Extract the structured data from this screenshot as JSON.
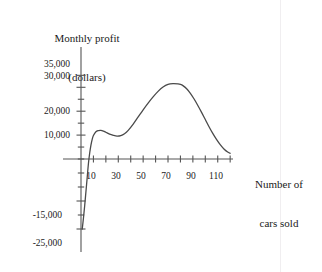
{
  "chart_data": {
    "type": "line",
    "title": "",
    "ylabel": "Monthly profit\n(dollars)",
    "ylabel_line1": "Monthly profit",
    "ylabel_line2": "(dollars)",
    "xlabel": "Number of\ncars sold",
    "xlabel_line1": "Number of",
    "xlabel_line2": "cars sold",
    "grid": false,
    "legend": null,
    "xlim": [
      0,
      125
    ],
    "ylim": [
      -25000,
      37500
    ],
    "x_tick_interval": 10,
    "y_tick_interval": 5000,
    "x_ticks": [
      10,
      20,
      30,
      40,
      50,
      60,
      70,
      80,
      90,
      100,
      110,
      120
    ],
    "x_tick_labels": [
      "10",
      "30",
      "50",
      "70",
      "90",
      "110"
    ],
    "x_labeled_ticks": [
      10,
      30,
      50,
      70,
      90,
      110
    ],
    "y_ticks": [
      -25000,
      -20000,
      -15000,
      -10000,
      -5000,
      0,
      5000,
      10000,
      15000,
      20000,
      25000,
      30000,
      35000
    ],
    "y_tick_labels": [
      "35,000",
      "30,000",
      "20,000",
      "10,000",
      "-15,000",
      "-25,000"
    ],
    "y_labeled_ticks": [
      35000,
      30000,
      20000,
      10000,
      -15000,
      -25000
    ],
    "series": [
      {
        "name": "Monthly profit",
        "color": "#4a4a4a",
        "x": [
          1,
          2,
          3,
          4,
          5,
          6,
          7,
          8,
          9,
          10,
          12,
          14,
          16,
          18,
          20,
          23,
          26,
          29,
          32,
          35,
          38,
          42,
          46,
          50,
          54,
          58,
          62,
          66,
          70,
          74,
          78,
          80,
          82,
          85,
          88,
          91,
          94,
          97,
          100,
          103,
          106,
          109,
          112,
          115,
          118,
          120
        ],
        "y": [
          -25000,
          -21000,
          -16500,
          -11500,
          -6500,
          -1500,
          2500,
          5800,
          8200,
          9800,
          11400,
          11900,
          12000,
          11700,
          11200,
          10400,
          9900,
          9600,
          9800,
          10600,
          12000,
          14600,
          17600,
          20600,
          23400,
          26000,
          28300,
          30100,
          31200,
          31500,
          31400,
          31200,
          30700,
          29400,
          27500,
          25100,
          22400,
          19500,
          16500,
          13500,
          10700,
          8200,
          6000,
          4200,
          2900,
          2400
        ]
      }
    ],
    "annotations": {
      "local_max": {
        "x": 16,
        "y": 12000
      },
      "local_min": {
        "x": 30,
        "y": 9550
      },
      "global_max": {
        "x": 76,
        "y": 31500
      },
      "zero_crossing": {
        "x": 6.5,
        "y": 0
      },
      "start": {
        "x": 1,
        "y": -25000
      },
      "end": {
        "x": 120,
        "y": 2400
      }
    }
  },
  "axes": {
    "axis_color": "#555555",
    "curve_color": "#4a4a4a",
    "background": "#ffffff"
  }
}
